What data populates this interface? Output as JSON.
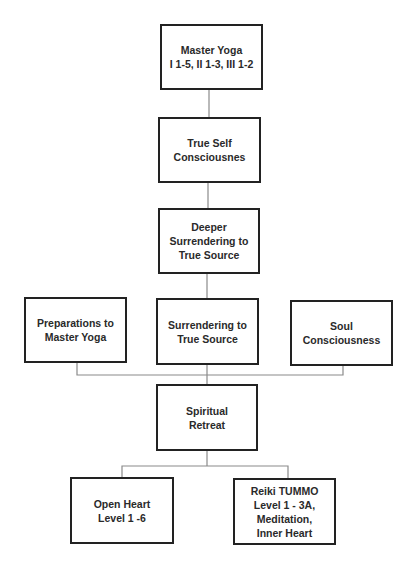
{
  "diagram": {
    "type": "flowchart",
    "colors": {
      "border": "#222222",
      "connector": "#8a8a8a",
      "text": "#2a2a2a",
      "background": "#ffffff"
    },
    "nodes": [
      {
        "id": "master-yoga",
        "label": "Master Yoga\nI 1-5, II 1-3, III 1-2"
      },
      {
        "id": "true-self",
        "label": "True Self\nConsciousnes"
      },
      {
        "id": "deeper-surrendering",
        "label": "Deeper\nSurrendering to\nTrue Source"
      },
      {
        "id": "preparations",
        "label": "Preparations to\nMaster Yoga"
      },
      {
        "id": "surrendering",
        "label": "Surrendering to\nTrue Source"
      },
      {
        "id": "soul",
        "label": "Soul\nConsciousness"
      },
      {
        "id": "spiritual-retreat",
        "label": "Spiritual\nRetreat"
      },
      {
        "id": "open-heart",
        "label": "Open Heart\nLevel 1 -6"
      },
      {
        "id": "reiki-tummo",
        "label": "Reiki TUMMO\nLevel 1 - 3A,\nMeditation,\nInner Heart"
      }
    ],
    "edges": [
      [
        "master-yoga",
        "true-self"
      ],
      [
        "true-self",
        "deeper-surrendering"
      ],
      [
        "deeper-surrendering",
        "surrendering"
      ],
      [
        "preparations",
        "spiritual-retreat"
      ],
      [
        "surrendering",
        "spiritual-retreat"
      ],
      [
        "soul",
        "spiritual-retreat"
      ],
      [
        "spiritual-retreat",
        "open-heart"
      ],
      [
        "spiritual-retreat",
        "reiki-tummo"
      ]
    ]
  }
}
